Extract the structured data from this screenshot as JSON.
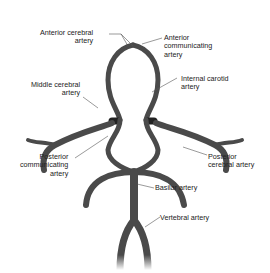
{
  "diagram": {
    "colors": {
      "artery": "#4a4a4a",
      "artery_highlight": "#8a8a8a",
      "leader": "#555555",
      "text": "#222222",
      "background": "#ffffff"
    },
    "labels": {
      "anterior_cerebral": "Anterior cerebral\nartery",
      "anterior_communicating": "Anterior\ncommunicating\nartery",
      "internal_carotid": "Internal carotid\nartery",
      "middle_cerebral": "Middle cerebral\nartery",
      "posterior_communicating": "Posterior\ncommunicating\nartery",
      "posterior_cerebral": "Posterior\ncerebral artery",
      "basilar": "Basilar artery",
      "vertebral": "Vertebral artery"
    }
  }
}
